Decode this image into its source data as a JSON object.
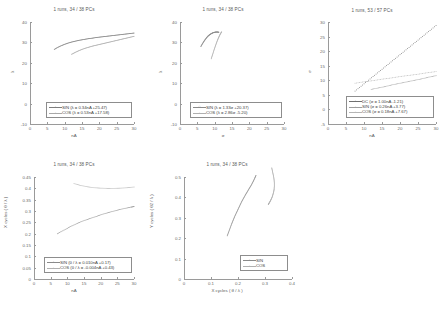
{
  "figure": {
    "background": "#ffffff",
    "axis_color": "#9a9a9a",
    "text_color": "#4a4a4a"
  },
  "chart_data": [
    {
      "id": "plot-lambda-vs-na",
      "type": "scatter",
      "title": "1 runs, 34 / 38 PCs",
      "xlabel": "nA",
      "ylabel": "λ",
      "xlim": [
        0,
        30
      ],
      "ylim": [
        -10,
        40
      ],
      "xticks": [
        "0",
        "5",
        "10",
        "15",
        "20",
        "25",
        "30"
      ],
      "yticks": [
        "-10",
        "0",
        "10",
        "20",
        "30",
        "40"
      ],
      "grid": false,
      "legend_position": "lower-right",
      "series": [
        {
          "name": "SIN",
          "label": "SIN  (λ = 0.34nA +25.47)",
          "slope": 0.34,
          "intercept": 25.47,
          "marker": "+",
          "color": "#7d7d7d",
          "x": [
            7,
            8,
            9,
            10,
            11,
            12,
            13,
            14,
            15,
            16,
            17,
            18,
            19,
            20,
            21,
            22,
            23,
            24,
            25,
            26,
            27,
            28,
            29,
            30
          ],
          "y": [
            26.6,
            27.6,
            28.4,
            29.1,
            29.7,
            30.2,
            30.6,
            31.0,
            31.3,
            31.6,
            31.9,
            32.1,
            32.4,
            32.6,
            32.8,
            33.0,
            33.2,
            33.4,
            33.6,
            33.8,
            34.0,
            34.2,
            34.4,
            34.6
          ]
        },
        {
          "name": "COS",
          "label": "COS  (λ = 0.53nA +17.58)",
          "slope": 0.53,
          "intercept": 17.58,
          "marker": "+",
          "color": "#a8a8a8",
          "x": [
            12,
            13,
            14,
            15,
            16,
            17,
            18,
            19,
            20,
            21,
            22,
            23,
            24,
            25,
            26,
            27,
            28,
            29,
            30
          ],
          "y": [
            24.2,
            25.1,
            25.9,
            26.6,
            27.2,
            27.7,
            28.2,
            28.6,
            29.0,
            29.4,
            29.8,
            30.2,
            30.6,
            31.0,
            31.4,
            31.8,
            32.2,
            32.6,
            33.0
          ]
        }
      ]
    },
    {
      "id": "plot-lambda-vs-sigma",
      "type": "scatter",
      "title": "1 runs, 34 / 38 PCs",
      "xlabel": "σ",
      "ylabel": "λ",
      "xlim": [
        0,
        30
      ],
      "ylim": [
        -10,
        40
      ],
      "xticks": [
        "0",
        "5",
        "10",
        "15",
        "20",
        "25",
        "30"
      ],
      "yticks": [
        "-10",
        "0",
        "10",
        "20",
        "30",
        "40"
      ],
      "grid": false,
      "legend_position": "lower-right",
      "series": [
        {
          "name": "SIN",
          "label": "SIN (λ = 1.33σ +20.37)",
          "slope": 1.33,
          "intercept": 20.37,
          "marker": "○",
          "color": "#8a8a8a",
          "x": [
            6.0,
            6.4,
            6.8,
            7.2,
            7.6,
            8.0,
            8.4,
            8.8,
            9.2,
            9.6,
            10.0,
            10.4,
            10.8,
            11.2
          ],
          "y": [
            28.0,
            29.2,
            30.3,
            31.3,
            32.2,
            33.0,
            33.6,
            34.1,
            34.5,
            34.8,
            35.0,
            35.1,
            35.1,
            35.0
          ]
        },
        {
          "name": "COS",
          "label": "COS (λ = 2.86σ -5.20)",
          "slope": 2.86,
          "intercept": -5.2,
          "marker": "+",
          "color": "#b0b0b0",
          "x": [
            9.0,
            9.3,
            9.6,
            9.9,
            10.2,
            10.5,
            10.8,
            11.1,
            11.4,
            11.7,
            12.0
          ],
          "y": [
            22.0,
            23.6,
            25.2,
            26.8,
            28.3,
            29.7,
            31.1,
            32.3,
            33.4,
            34.4,
            35.2
          ]
        }
      ]
    },
    {
      "id": "plot-sigma-vs-na",
      "type": "scatter",
      "title": "1 runs, 53 / 57 PCs",
      "xlabel": "nA",
      "ylabel": "σ",
      "xlim": [
        0,
        30
      ],
      "ylim": [
        -5,
        30
      ],
      "xticks": [
        "0",
        "5",
        "10",
        "15",
        "20",
        "25",
        "30"
      ],
      "yticks": [
        "-5",
        "0",
        "5",
        "10",
        "15",
        "20",
        "25",
        "30"
      ],
      "grid": false,
      "legend_position": "lower-right",
      "series": [
        {
          "name": "DC",
          "label": "DC  (σ = 1.00nA -1.21)",
          "slope": 1.0,
          "intercept": -1.21,
          "marker": "·",
          "color": "#6f6f6f",
          "x": [
            7.5,
            10,
            12.5,
            15,
            17.5,
            20,
            22.5,
            25,
            27.5,
            30
          ],
          "y": [
            6.3,
            8.8,
            11.3,
            13.8,
            16.3,
            18.8,
            21.3,
            23.8,
            26.3,
            28.8
          ]
        },
        {
          "name": "SIN",
          "label": "SIN  (σ = 0.26nA +3.77)",
          "slope": 0.26,
          "intercept": 3.77,
          "marker": "+",
          "color": "#9d9d9d",
          "x": [
            12,
            14,
            16,
            18,
            20,
            22,
            24,
            26,
            28,
            30
          ],
          "y": [
            6.9,
            7.4,
            7.9,
            8.5,
            9.0,
            9.5,
            10.0,
            10.5,
            11.1,
            11.6
          ]
        },
        {
          "name": "COS",
          "label": "COS  (σ = 0.18nA +7.67)",
          "slope": 0.18,
          "intercept": 7.67,
          "marker": "+",
          "color": "#b5b5b5",
          "x": [
            7.5,
            10,
            12.5,
            15,
            17.5,
            20,
            22.5,
            25,
            27.5,
            30
          ],
          "y": [
            9.0,
            9.5,
            9.9,
            10.4,
            10.8,
            11.3,
            11.7,
            12.1,
            12.6,
            13.0
          ]
        }
      ]
    },
    {
      "id": "plot-xcycles-vs-na",
      "type": "scatter",
      "title": "1 runs, 34 / 38 PCs",
      "xlabel": "nA",
      "ylabel": "X cycles ( θ / λ )",
      "xlim": [
        0,
        30
      ],
      "ylim": [
        0,
        0.45
      ],
      "xticks": [
        "0",
        "5",
        "10",
        "15",
        "20",
        "25",
        "30"
      ],
      "yticks": [
        "0",
        "0.05",
        "0.1",
        "0.15",
        "0.2",
        "0.25",
        "0.3",
        "0.35",
        "0.4",
        "0.45"
      ],
      "grid": false,
      "legend_position": "lower-right",
      "series": [
        {
          "name": "SIN",
          "label": "SIN  (θ / λ = 0.010nA +0.17)",
          "slope": 0.01,
          "intercept": 0.17,
          "marker": "+",
          "color": "#8a8a8a",
          "x": [
            7,
            9,
            11,
            13,
            15,
            17,
            19,
            21,
            23,
            25,
            27,
            29,
            30
          ],
          "y": [
            0.2,
            0.216,
            0.232,
            0.246,
            0.258,
            0.268,
            0.278,
            0.288,
            0.296,
            0.304,
            0.311,
            0.317,
            0.32
          ]
        },
        {
          "name": "COS",
          "label": "COS  (θ / λ = -0.004nA +0.43)",
          "slope": -0.004,
          "intercept": 0.43,
          "marker": "+",
          "color": "#b0b0b0",
          "x": [
            12,
            14,
            16,
            18,
            20,
            22,
            24,
            26,
            28,
            30
          ],
          "y": [
            0.421,
            0.413,
            0.407,
            0.403,
            0.401,
            0.4,
            0.4,
            0.401,
            0.403,
            0.406
          ]
        }
      ]
    },
    {
      "id": "plot-ycycles-vs-xcycles",
      "type": "scatter",
      "title": "1 runs, 34 / 38 PCs",
      "xlabel": "X cycles ( θ / λ )",
      "ylabel": "Y cycles ( θ2 / λ )",
      "xlim": [
        0,
        0.5
      ],
      "ylim": [
        0,
        0.5
      ],
      "xticks": [
        "0",
        "0.1",
        "0.2",
        "0.3",
        "0.4"
      ],
      "yticks": [
        "0",
        "0.1",
        "0.2",
        "0.3",
        "0.4",
        "0.5"
      ],
      "grid": false,
      "legend_position": "lower-right",
      "series": [
        {
          "name": "SIN",
          "label": "SIN",
          "marker": "+",
          "color": "#8a8a8a",
          "x": [
            0.2,
            0.207,
            0.214,
            0.221,
            0.228,
            0.235,
            0.243,
            0.251,
            0.259,
            0.267,
            0.276,
            0.285,
            0.294,
            0.303,
            0.312,
            0.32,
            0.327,
            0.333
          ],
          "y": [
            0.212,
            0.232,
            0.252,
            0.272,
            0.29,
            0.308,
            0.326,
            0.344,
            0.362,
            0.38,
            0.397,
            0.414,
            0.43,
            0.446,
            0.462,
            0.478,
            0.494,
            0.508
          ]
        },
        {
          "name": "COS",
          "label": "COS",
          "marker": "+",
          "color": "#b0b0b0",
          "x": [
            0.406,
            0.409,
            0.412,
            0.415,
            0.417,
            0.418,
            0.418,
            0.417,
            0.415,
            0.412,
            0.409,
            0.405,
            0.401,
            0.397,
            0.393,
            0.39
          ],
          "y": [
            0.545,
            0.53,
            0.515,
            0.5,
            0.485,
            0.47,
            0.455,
            0.44,
            0.428,
            0.416,
            0.405,
            0.395,
            0.386,
            0.378,
            0.371,
            0.365
          ]
        }
      ]
    }
  ]
}
